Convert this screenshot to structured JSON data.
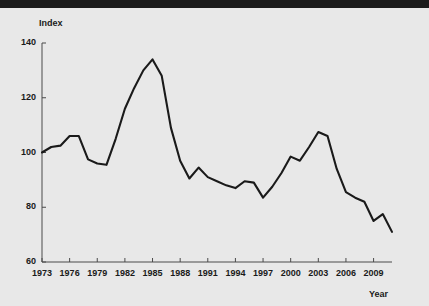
{
  "figure": {
    "background_color": "#e8e8e8",
    "band_color": "#1c1c1c",
    "line_color": "#1a1a1a",
    "axis_color": "#4a4a4a"
  },
  "chart_data": {
    "type": "line",
    "title": "",
    "subtitle": "",
    "xlabel": "Year",
    "ylabel": "Index",
    "xlim": [
      1973,
      2011
    ],
    "ylim": [
      60,
      140
    ],
    "grid": false,
    "legend": "none",
    "y_ticks": [
      140,
      120,
      100,
      80,
      60
    ],
    "x_ticks": [
      1973,
      1976,
      1979,
      1982,
      1985,
      1988,
      1991,
      1994,
      1997,
      2000,
      2003,
      2006,
      2009
    ],
    "x": [
      1973,
      1974,
      1975,
      1976,
      1977,
      1978,
      1979,
      1980,
      1981,
      1982,
      1983,
      1984,
      1985,
      1986,
      1987,
      1988,
      1989,
      1990,
      1991,
      1992,
      1993,
      1994,
      1995,
      1996,
      1997,
      1998,
      1999,
      2000,
      2001,
      2002,
      2003,
      2004,
      2005,
      2006,
      2007,
      2008,
      2009,
      2010,
      2011
    ],
    "values": [
      100.0,
      102.0,
      102.5,
      106.0,
      106.0,
      97.5,
      96.0,
      95.5,
      105.0,
      116.0,
      123.5,
      130.0,
      134.0,
      128.0,
      109.0,
      97.0,
      90.5,
      94.5,
      91.0,
      89.5,
      88.0,
      87.0,
      89.5,
      89.0,
      83.5,
      87.5,
      92.5,
      98.5,
      97.0,
      102.0,
      107.5,
      106.0,
      94.0,
      85.5,
      83.5,
      82.0,
      75.0,
      77.5,
      71.0
    ],
    "series_name": "Index"
  },
  "labels": {
    "index": "Index",
    "year": "Year"
  }
}
